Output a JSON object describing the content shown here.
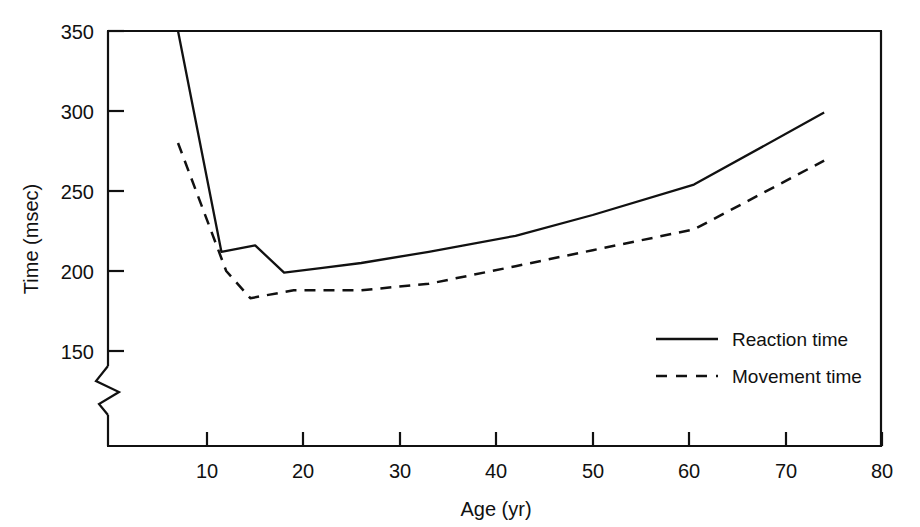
{
  "chart_data": {
    "type": "line",
    "title": "",
    "subtitle": "",
    "xlabel": "Age (yr)",
    "ylabel": "Time (msec)",
    "xlim": [
      0,
      80
    ],
    "ylim": [
      150,
      350
    ],
    "y_axis_break": true,
    "y_axis_break_note": "axis broken below 150",
    "grid": false,
    "legend_position": "inside-lower-right",
    "xticks": [
      10,
      20,
      30,
      40,
      50,
      60,
      70,
      80
    ],
    "xtick_labels": [
      "10",
      "20",
      "30",
      "40",
      "50",
      "60",
      "70",
      "80"
    ],
    "yticks": [
      150,
      200,
      250,
      300,
      350
    ],
    "ytick_labels": [
      "150",
      "200",
      "250",
      "300",
      "350"
    ],
    "series": [
      {
        "name": "Reaction time",
        "style": "solid",
        "color": "#111111",
        "x": [
          7,
          11.5,
          15,
          18,
          22,
          26,
          33,
          42,
          50,
          60.5,
          74
        ],
        "values": [
          350,
          212,
          216,
          199,
          202,
          205,
          212,
          222,
          235,
          254,
          299
        ]
      },
      {
        "name": "Movement time",
        "style": "dashed",
        "color": "#111111",
        "x": [
          7,
          12,
          14.5,
          19,
          22,
          26,
          33,
          42,
          50,
          60.5,
          74
        ],
        "values": [
          280,
          200,
          183,
          188,
          188,
          188,
          192,
          203,
          213,
          226,
          269
        ]
      }
    ]
  },
  "axes": {
    "y_title": "Time (msec)",
    "x_title": "Age (yr)",
    "y_labels": [
      "350",
      "300",
      "250",
      "200",
      "150"
    ],
    "x_labels": [
      "10",
      "20",
      "30",
      "40",
      "50",
      "60",
      "70",
      "80"
    ]
  },
  "legend": {
    "entries": [
      {
        "label": "Reaction time",
        "style": "solid"
      },
      {
        "label": "Movement time",
        "style": "dashed"
      }
    ]
  },
  "colors": {
    "ink": "#111111",
    "background": "#ffffff"
  }
}
